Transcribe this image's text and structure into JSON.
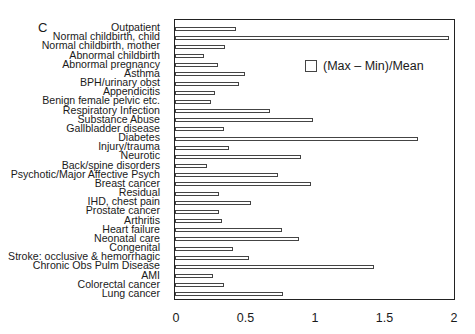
{
  "chart_data": {
    "type": "bar",
    "orientation": "horizontal",
    "panel_label": "C",
    "title": "",
    "xlabel": "",
    "ylabel": "",
    "xlim": [
      0,
      2
    ],
    "xticks": [
      "0",
      "0.5",
      "1",
      "1.5",
      "2"
    ],
    "grid": false,
    "legend": {
      "position": "upper right (inside)",
      "entries": [
        "(Max – Min)/Mean"
      ]
    },
    "categories": [
      "Outpatient",
      "Normal childbirth, child",
      "Normal childbirth, mother",
      "Abnormal childbirth",
      "Abnormal pregnancy",
      "Asthma",
      "BPH/urinary obst",
      "Appendicitis",
      "Benign female pelvic etc.",
      "Respiratory Infection",
      "Substance Abuse",
      "Gallbladder disease",
      "Diabetes",
      "Injury/trauma",
      "Neurotic",
      "Back/spine disorders",
      "Psychotic/Major Affective Psych",
      "Breast cancer",
      "Residual",
      "IHD, chest pain",
      "Prostate cancer",
      "Arthritis",
      "Heart failure",
      "Neonatal care",
      "Congenital",
      "Stroke: occlusive & hemorrhagic",
      "Chronic Obs Pulm Disease",
      "AMI",
      "Colorectal cancer",
      "Lung cancer"
    ],
    "series": [
      {
        "name": "(Max – Min)/Mean",
        "values": [
          0.44,
          1.97,
          0.36,
          0.21,
          0.31,
          0.5,
          0.46,
          0.29,
          0.26,
          0.68,
          0.99,
          0.35,
          1.75,
          0.39,
          0.91,
          0.23,
          0.74,
          0.98,
          0.32,
          0.55,
          0.32,
          0.34,
          0.77,
          0.89,
          0.42,
          0.53,
          1.43,
          0.27,
          0.35,
          0.78
        ]
      }
    ]
  }
}
